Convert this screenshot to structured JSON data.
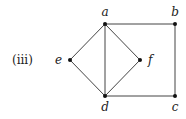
{
  "figure_label": "(iii)",
  "vertices": [
    {
      "id": "a",
      "label": "a"
    },
    {
      "id": "b",
      "label": "b"
    },
    {
      "id": "c",
      "label": "c"
    },
    {
      "id": "d",
      "label": "d"
    },
    {
      "id": "e",
      "label": "e"
    },
    {
      "id": "f",
      "label": "f"
    }
  ],
  "edges": [
    [
      "a",
      "b"
    ],
    [
      "b",
      "c"
    ],
    [
      "c",
      "d"
    ],
    [
      "a",
      "d"
    ],
    [
      "a",
      "e"
    ],
    [
      "e",
      "d"
    ],
    [
      "a",
      "f"
    ],
    [
      "f",
      "d"
    ]
  ]
}
